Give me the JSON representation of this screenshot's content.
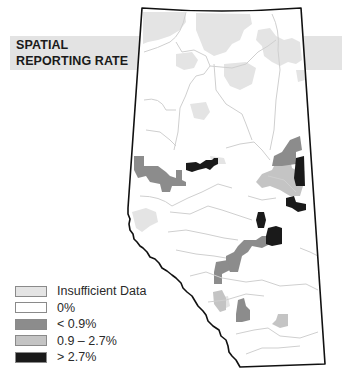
{
  "title": {
    "line1": "SPATIAL",
    "line2": "REPORTING RATE"
  },
  "colors": {
    "banner": "#e3e3e3",
    "boundary": "#111111",
    "rivers": "#cfcfcf",
    "insufficient": "#e4e4e4",
    "zero": "#ffffff",
    "low": "#8c8c8c",
    "mid": "#c4c4c4",
    "high": "#1a1a1a"
  },
  "legend": [
    {
      "label": "Insufficient Data",
      "category": "insufficient"
    },
    {
      "label": "0%",
      "category": "zero"
    },
    {
      "label": "< 0.9%",
      "category": "low"
    },
    {
      "label": "0.9 – 2.7%",
      "category": "mid"
    },
    {
      "label": "> 2.7%",
      "category": "high"
    }
  ],
  "regions": [
    {
      "category": "insufficient",
      "area": "north-west"
    },
    {
      "category": "insufficient",
      "area": "north-central"
    },
    {
      "category": "insufficient",
      "area": "north-east"
    },
    {
      "category": "insufficient",
      "area": "central-north"
    },
    {
      "category": "insufficient",
      "area": "west-central"
    },
    {
      "category": "low",
      "area": "west-central"
    },
    {
      "category": "high",
      "area": "central"
    },
    {
      "category": "low",
      "area": "east-central"
    },
    {
      "category": "mid",
      "area": "east-central"
    },
    {
      "category": "high",
      "area": "east-border"
    },
    {
      "category": "high",
      "area": "east-border-south"
    },
    {
      "category": "high",
      "area": "south-central"
    },
    {
      "category": "low",
      "area": "south-central"
    },
    {
      "category": "insufficient",
      "area": "south-west-foothills"
    },
    {
      "category": "low",
      "area": "south-west-foothills"
    },
    {
      "category": "mid",
      "area": "south-west"
    },
    {
      "category": "low",
      "area": "south"
    },
    {
      "category": "mid",
      "area": "south-east"
    }
  ]
}
